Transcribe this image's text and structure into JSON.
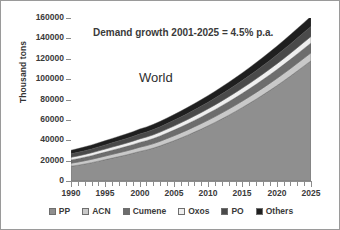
{
  "chart_data": {
    "type": "area",
    "stacked": true,
    "title": "",
    "xlabel": "",
    "ylabel": "Thousand tons",
    "ylim": [
      0,
      160000
    ],
    "ytick_values": [
      0,
      20000,
      40000,
      60000,
      80000,
      100000,
      120000,
      140000,
      160000
    ],
    "ytick_labels": [
      "0",
      "20000",
      "40000",
      "60000",
      "80000",
      "100000",
      "120000",
      "140000",
      "160000"
    ],
    "xlim": [
      1990,
      2025
    ],
    "xtick_labels": [
      "1990",
      "1995",
      "2000",
      "2005",
      "2010",
      "2015",
      "2020",
      "2025"
    ],
    "xtick_values": [
      1990,
      1995,
      2000,
      2005,
      2010,
      2015,
      2020,
      2025
    ],
    "minor_xticks_every": 1,
    "grid": false,
    "legend_position": "bottom",
    "annotations": [
      {
        "text": "Demand growth 2001-2025 = 4.5% p.a.",
        "x": 1993,
        "y": 146000
      },
      {
        "text": "World",
        "x": 2000,
        "y": 105000
      }
    ],
    "x": [
      1990,
      1991,
      1992,
      1993,
      1994,
      1995,
      1996,
      1997,
      1998,
      1999,
      2000,
      2001,
      2002,
      2003,
      2004,
      2005,
      2006,
      2007,
      2008,
      2009,
      2010,
      2011,
      2012,
      2013,
      2014,
      2015,
      2016,
      2017,
      2018,
      2019,
      2020,
      2021,
      2022,
      2023,
      2024,
      2025
    ],
    "series": [
      {
        "name": "PP",
        "color": "#8f8f8f",
        "values": [
          14500,
          15500,
          16700,
          18000,
          19500,
          21000,
          22500,
          24000,
          25500,
          27200,
          29000,
          30500,
          32300,
          34500,
          37000,
          39500,
          42200,
          45000,
          48000,
          51000,
          54200,
          57500,
          61000,
          64600,
          68300,
          72200,
          76200,
          80300,
          84600,
          89000,
          93500,
          98200,
          103000,
          108000,
          113000,
          118000
        ]
      },
      {
        "name": "ACN",
        "color": "#c9c9c9",
        "values": [
          3000,
          3100,
          3200,
          3300,
          3400,
          3500,
          3650,
          3800,
          3900,
          4000,
          4150,
          4250,
          4400,
          4550,
          4700,
          4850,
          5000,
          5150,
          5300,
          5450,
          5600,
          5750,
          5900,
          6050,
          6200,
          6350,
          6500,
          6650,
          6800,
          6950,
          7100,
          7250,
          7400,
          7550,
          7700,
          7850
        ]
      },
      {
        "name": "Cumene",
        "color": "#6d6d6d",
        "values": [
          3200,
          3300,
          3450,
          3600,
          3750,
          3900,
          4050,
          4200,
          4350,
          4500,
          4700,
          4850,
          5000,
          5200,
          5400,
          5600,
          5800,
          6000,
          6200,
          6400,
          6600,
          6800,
          7000,
          7200,
          7400,
          7600,
          7800,
          8000,
          8200,
          8400,
          8600,
          8800,
          9000,
          9200,
          9400,
          9600
        ]
      },
      {
        "name": "Oxos",
        "color": "#efefef",
        "values": [
          2600,
          2680,
          2760,
          2840,
          2930,
          3020,
          3110,
          3200,
          3290,
          3380,
          3480,
          3570,
          3670,
          3770,
          3870,
          3980,
          4080,
          4190,
          4300,
          4410,
          4520,
          4640,
          4750,
          4870,
          4990,
          5110,
          5230,
          5360,
          5480,
          5610,
          5740,
          5870,
          6000,
          6140,
          6270,
          6410
        ]
      },
      {
        "name": "PO",
        "color": "#4a4a4a",
        "values": [
          3400,
          3520,
          3640,
          3770,
          3900,
          4040,
          4180,
          4320,
          4460,
          4610,
          4770,
          4920,
          5080,
          5240,
          5410,
          5580,
          5760,
          5940,
          6120,
          6310,
          6500,
          6700,
          6900,
          7100,
          7310,
          7520,
          7740,
          7960,
          8180,
          8410,
          8650,
          8890,
          9130,
          9380,
          9630,
          9890
        ]
      },
      {
        "name": "Others",
        "color": "#1f1f1f",
        "values": [
          3600,
          3700,
          3820,
          3940,
          4060,
          4190,
          4320,
          4450,
          4590,
          4730,
          4880,
          5020,
          5170,
          5330,
          5490,
          5650,
          5820,
          5990,
          6170,
          6350,
          6540,
          6730,
          6930,
          7130,
          7340,
          7550,
          7770,
          7990,
          8220,
          8450,
          8690,
          8940,
          9190,
          9440,
          9700,
          9970
        ]
      }
    ],
    "totals": [
      30300,
      31800,
      33570,
      35450,
      37540,
      39650,
      41810,
      44970,
      48000,
      50420,
      50980,
      53110,
      55620,
      58590,
      61870,
      65160,
      68660,
      72270,
      76090,
      79920,
      83960,
      88120,
      92480,
      96950,
      101540,
      106330,
      111240,
      116260,
      121480,
      126820,
      132280,
      137960,
      143720,
      149710,
      155700,
      160720
    ]
  },
  "axes": {
    "y_title": "Thousand tons"
  },
  "legend": {
    "items": [
      {
        "label": "PP",
        "color": "#8f8f8f"
      },
      {
        "label": "ACN",
        "color": "#c9c9c9"
      },
      {
        "label": "Cumene",
        "color": "#6d6d6d"
      },
      {
        "label": "Oxos",
        "color": "#efefef"
      },
      {
        "label": "PO",
        "color": "#4a4a4a"
      },
      {
        "label": "Others",
        "color": "#1f1f1f"
      }
    ]
  }
}
